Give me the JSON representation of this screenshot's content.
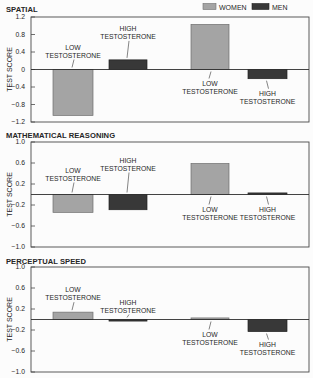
{
  "legend": [
    {
      "name": "WOMEN",
      "color": "#a4a4a4",
      "stroke": "#6e6e6e"
    },
    {
      "name": "MEN",
      "color": "#383838",
      "stroke": "#222222"
    }
  ],
  "chart_data": [
    {
      "id": "spatial",
      "type": "bar",
      "title": "SPATIAL",
      "xlabel": "",
      "ylabel": "TEST SCORE",
      "ylim": [
        -1.2,
        1.2
      ],
      "yticks": [
        1.2,
        0.8,
        0.4,
        0,
        -0.4,
        -0.8,
        -1.2
      ],
      "ytick_labels": [
        "1.2",
        "0.8",
        "0.4",
        "0",
        "−0.4",
        "−0.8",
        "−1.2"
      ],
      "grid": false,
      "legend_position": "top-right",
      "categories": [
        "LOW TESTOSTERONE",
        "HIGH TESTOSTERONE",
        "LOW TESTOSTERONE",
        "HIGH TESTOSTERONE"
      ],
      "bar_series": [
        "WOMEN",
        "MEN",
        "WOMEN",
        "MEN"
      ],
      "values": [
        -1.05,
        0.22,
        1.03,
        -0.21
      ]
    },
    {
      "id": "mathematical-reasoning",
      "type": "bar",
      "title": "MATHEMATICAL REASONING",
      "xlabel": "",
      "ylabel": "TEST SCORE",
      "ylim": [
        -1.0,
        1.0
      ],
      "yticks": [
        1.0,
        0.6,
        0.2,
        -0.2,
        -0.6,
        -1.0
      ],
      "ytick_labels": [
        "1.0",
        "0.6",
        "0.2",
        "−0.2",
        "−0.6",
        "−1.0"
      ],
      "grid": false,
      "categories": [
        "LOW TESTOSTERONE",
        "HIGH TESTOSTERONE",
        "LOW TESTOSTERONE",
        "HIGH TESTOSTERONE"
      ],
      "bar_series": [
        "WOMEN",
        "MEN",
        "WOMEN",
        "MEN"
      ],
      "values": [
        -0.34,
        -0.29,
        0.59,
        0.03
      ]
    },
    {
      "id": "perceptual-speed",
      "type": "bar",
      "title": "PERCEPTUAL SPEED",
      "xlabel": "",
      "ylabel": "TEST SCORE",
      "ylim": [
        -1.0,
        1.0
      ],
      "yticks": [
        1.0,
        0.6,
        0.2,
        -0.2,
        -0.6,
        -1.0
      ],
      "ytick_labels": [
        "1.0",
        "0.6",
        "0.2",
        "−0.2",
        "−0.6",
        "−1.0"
      ],
      "grid": false,
      "categories": [
        "LOW TESTOSTERONE",
        "HIGH TESTOSTERONE",
        "LOW TESTOSTERONE",
        "HIGH TESTOSTERONE"
      ],
      "bar_series": [
        "WOMEN",
        "MEN",
        "WOMEN",
        "MEN"
      ],
      "values": [
        0.14,
        -0.03,
        0.03,
        -0.23
      ]
    }
  ]
}
